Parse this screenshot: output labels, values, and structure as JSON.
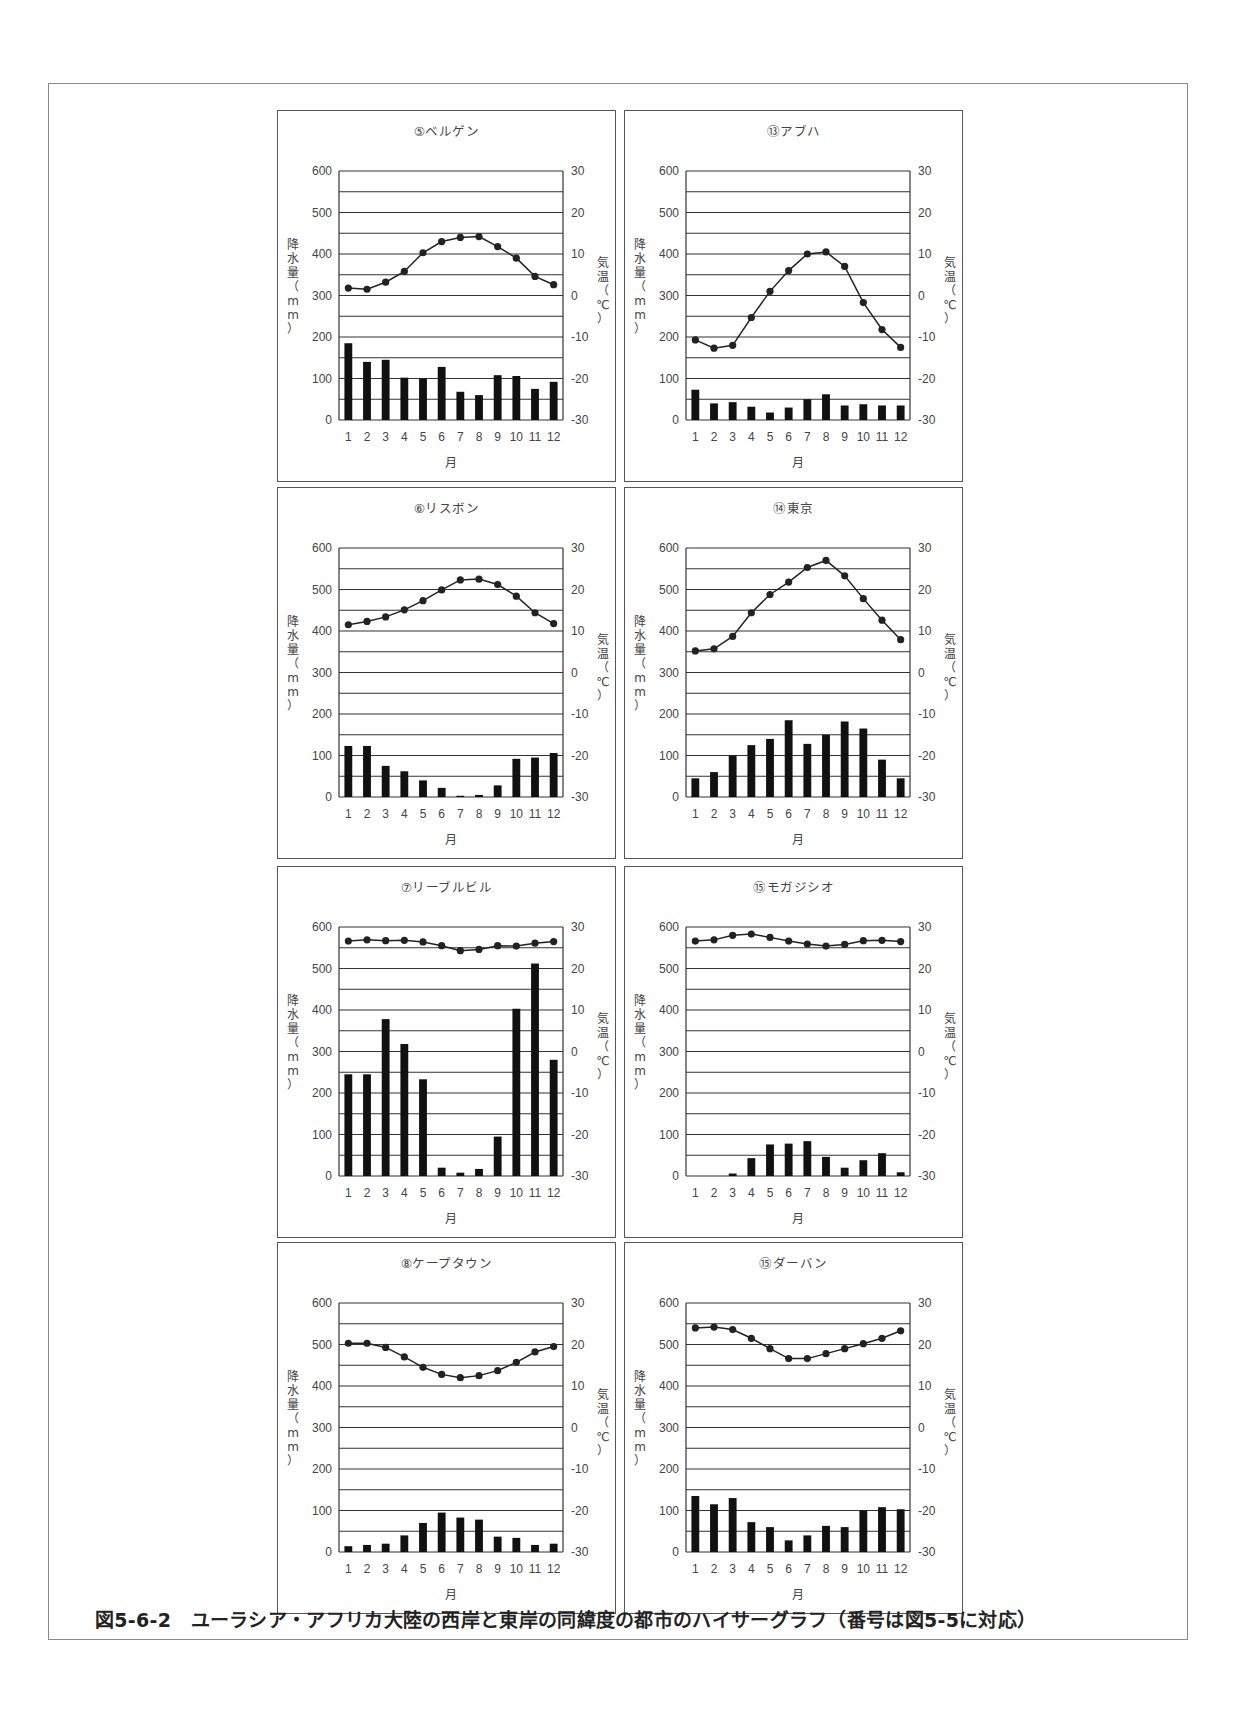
{
  "caption": "図5-6-2　ユーラシア・アフリカ大陸の西岸と東岸の同緯度の都市のハイサーグラフ（番号は図5-5に対応）",
  "axis_labels": {
    "left_vertical": [
      "降",
      "水",
      "量",
      "（",
      "m",
      "m",
      "）"
    ],
    "right_vertical": [
      "気",
      "温",
      "（",
      "℃",
      "）"
    ],
    "x_label": "月"
  },
  "colors": {
    "bar": "#111111",
    "line": "#222222",
    "grid": "#333333",
    "frame": "#555555"
  },
  "chart_data": [
    {
      "type": "bar+line",
      "title": "⑤ベルゲン",
      "categories": [
        "1",
        "2",
        "3",
        "4",
        "5",
        "6",
        "7",
        "8",
        "9",
        "10",
        "11",
        "12"
      ],
      "xlabel": "月",
      "ylabel": "降水量（mm）",
      "y2label": "気温（℃）",
      "ylim": [
        0,
        600
      ],
      "y2lim": [
        -30,
        30
      ],
      "yticks": [
        0,
        100,
        200,
        300,
        400,
        500,
        600
      ],
      "y2ticks": [
        -30,
        -20,
        -10,
        0,
        10,
        20,
        30
      ],
      "grid": true,
      "series": [
        {
          "name": "降水量",
          "axis": "left",
          "kind": "bar",
          "values": [
            185,
            140,
            145,
            102,
            100,
            128,
            68,
            60,
            108,
            106,
            75,
            92
          ]
        },
        {
          "name": "気温",
          "axis": "right",
          "kind": "line",
          "values": [
            1.8,
            1.5,
            3.2,
            5.8,
            10.3,
            13.0,
            14.0,
            14.2,
            11.8,
            9.0,
            4.6,
            2.6
          ]
        }
      ]
    },
    {
      "type": "bar+line",
      "title": "⑬アブハ",
      "categories": [
        "1",
        "2",
        "3",
        "4",
        "5",
        "6",
        "7",
        "8",
        "9",
        "10",
        "11",
        "12"
      ],
      "xlabel": "月",
      "ylabel": "降水量（mm）",
      "y2label": "気温（℃）",
      "ylim": [
        0,
        600
      ],
      "y2lim": [
        -30,
        30
      ],
      "yticks": [
        0,
        100,
        200,
        300,
        400,
        500,
        600
      ],
      "y2ticks": [
        -30,
        -20,
        -10,
        0,
        10,
        20,
        30
      ],
      "grid": true,
      "series": [
        {
          "name": "降水量",
          "axis": "left",
          "kind": "bar",
          "values": [
            73,
            40,
            43,
            32,
            18,
            30,
            50,
            62,
            35,
            38,
            35,
            35
          ]
        },
        {
          "name": "気温",
          "axis": "right",
          "kind": "line",
          "values": [
            -10.7,
            -12.7,
            -12.0,
            -5.3,
            1.0,
            6.0,
            10.0,
            10.5,
            7.0,
            -1.7,
            -8.2,
            -12.5
          ]
        }
      ]
    },
    {
      "type": "bar+line",
      "title": "⑥リスボン",
      "categories": [
        "1",
        "2",
        "3",
        "4",
        "5",
        "6",
        "7",
        "8",
        "9",
        "10",
        "11",
        "12"
      ],
      "xlabel": "月",
      "ylabel": "降水量（mm）",
      "y2label": "気温（℃）",
      "ylim": [
        0,
        600
      ],
      "y2lim": [
        -30,
        30
      ],
      "yticks": [
        0,
        100,
        200,
        300,
        400,
        500,
        600
      ],
      "y2ticks": [
        -30,
        -20,
        -10,
        0,
        10,
        20,
        30
      ],
      "grid": true,
      "series": [
        {
          "name": "降水量",
          "axis": "left",
          "kind": "bar",
          "values": [
            123,
            123,
            75,
            62,
            40,
            22,
            3,
            5,
            28,
            92,
            95,
            106
          ]
        },
        {
          "name": "気温",
          "axis": "right",
          "kind": "line",
          "values": [
            11.5,
            12.3,
            13.4,
            15.1,
            17.3,
            19.9,
            22.3,
            22.5,
            21.2,
            18.4,
            14.4,
            11.8
          ]
        }
      ]
    },
    {
      "type": "bar+line",
      "title": "⑭東京",
      "categories": [
        "1",
        "2",
        "3",
        "4",
        "5",
        "6",
        "7",
        "8",
        "9",
        "10",
        "11",
        "12"
      ],
      "xlabel": "月",
      "ylabel": "降水量（mm）",
      "y2label": "気温（℃）",
      "ylim": [
        0,
        600
      ],
      "y2lim": [
        -30,
        30
      ],
      "yticks": [
        0,
        100,
        200,
        300,
        400,
        500,
        600
      ],
      "y2ticks": [
        -30,
        -20,
        -10,
        0,
        10,
        20,
        30
      ],
      "grid": true,
      "series": [
        {
          "name": "降水量",
          "axis": "left",
          "kind": "bar",
          "values": [
            45,
            60,
            100,
            125,
            140,
            185,
            128,
            150,
            182,
            165,
            90,
            45
          ]
        },
        {
          "name": "気温",
          "axis": "right",
          "kind": "line",
          "values": [
            5.2,
            5.7,
            8.7,
            14.4,
            18.8,
            21.8,
            25.3,
            27.0,
            23.3,
            17.8,
            12.6,
            7.9
          ]
        }
      ]
    },
    {
      "type": "bar+line",
      "title": "⑦リーブルビル",
      "categories": [
        "1",
        "2",
        "3",
        "4",
        "5",
        "6",
        "7",
        "8",
        "9",
        "10",
        "11",
        "12"
      ],
      "xlabel": "月",
      "ylabel": "降水量（mm）",
      "y2label": "気温（℃）",
      "ylim": [
        0,
        600
      ],
      "y2lim": [
        -30,
        30
      ],
      "yticks": [
        0,
        100,
        200,
        300,
        400,
        500,
        600
      ],
      "y2ticks": [
        -30,
        -20,
        -10,
        0,
        10,
        20,
        30
      ],
      "grid": true,
      "series": [
        {
          "name": "降水量",
          "axis": "left",
          "kind": "bar",
          "values": [
            245,
            245,
            378,
            318,
            233,
            20,
            8,
            17,
            95,
            403,
            512,
            280
          ]
        },
        {
          "name": "気温",
          "axis": "right",
          "kind": "line",
          "values": [
            26.6,
            26.9,
            26.7,
            26.8,
            26.4,
            25.5,
            24.3,
            24.6,
            25.5,
            25.4,
            26.1,
            26.5
          ]
        }
      ]
    },
    {
      "type": "bar+line",
      "title": "⑮モガジシオ",
      "categories": [
        "1",
        "2",
        "3",
        "4",
        "5",
        "6",
        "7",
        "8",
        "9",
        "10",
        "11",
        "12"
      ],
      "xlabel": "月",
      "ylabel": "降水量（mm）",
      "y2label": "気温（℃）",
      "ylim": [
        0,
        600
      ],
      "y2lim": [
        -30,
        30
      ],
      "yticks": [
        0,
        100,
        200,
        300,
        400,
        500,
        600
      ],
      "y2ticks": [
        -30,
        -20,
        -10,
        0,
        10,
        20,
        30
      ],
      "grid": true,
      "series": [
        {
          "name": "降水量",
          "axis": "left",
          "kind": "bar",
          "values": [
            0,
            0,
            6,
            43,
            76,
            78,
            84,
            46,
            20,
            38,
            55,
            9
          ]
        },
        {
          "name": "気温",
          "axis": "right",
          "kind": "line",
          "values": [
            26.6,
            26.9,
            28.0,
            28.3,
            27.5,
            26.6,
            25.9,
            25.4,
            25.8,
            26.7,
            26.8,
            26.5
          ]
        }
      ]
    },
    {
      "type": "bar+line",
      "title": "⑧ケープタウン",
      "categories": [
        "1",
        "2",
        "3",
        "4",
        "5",
        "6",
        "7",
        "8",
        "9",
        "10",
        "11",
        "12"
      ],
      "xlabel": "月",
      "ylabel": "降水量（mm）",
      "y2label": "気温（℃）",
      "ylim": [
        0,
        600
      ],
      "y2lim": [
        -30,
        30
      ],
      "yticks": [
        0,
        100,
        200,
        300,
        400,
        500,
        600
      ],
      "y2ticks": [
        -30,
        -20,
        -10,
        0,
        10,
        20,
        30
      ],
      "grid": true,
      "series": [
        {
          "name": "降水量",
          "axis": "left",
          "kind": "bar",
          "values": [
            14,
            17,
            20,
            40,
            70,
            95,
            83,
            78,
            37,
            34,
            17,
            20
          ]
        },
        {
          "name": "気温",
          "axis": "right",
          "kind": "line",
          "values": [
            20.3,
            20.3,
            19.3,
            17.0,
            14.5,
            12.8,
            12.0,
            12.5,
            13.7,
            15.7,
            18.2,
            19.5
          ]
        }
      ]
    },
    {
      "type": "bar+line",
      "title": "⑮ダーバン",
      "categories": [
        "1",
        "2",
        "3",
        "4",
        "5",
        "6",
        "7",
        "8",
        "9",
        "10",
        "11",
        "12"
      ],
      "xlabel": "月",
      "ylabel": "降水量（mm）",
      "y2label": "気温（℃）",
      "ylim": [
        0,
        600
      ],
      "y2lim": [
        -30,
        30
      ],
      "yticks": [
        0,
        100,
        200,
        300,
        400,
        500,
        600
      ],
      "y2ticks": [
        -30,
        -20,
        -10,
        0,
        10,
        20,
        30
      ],
      "grid": true,
      "series": [
        {
          "name": "降水量",
          "axis": "left",
          "kind": "bar",
          "values": [
            135,
            115,
            130,
            72,
            60,
            28,
            40,
            63,
            60,
            100,
            108,
            103
          ]
        },
        {
          "name": "気温",
          "axis": "right",
          "kind": "line",
          "values": [
            24.0,
            24.2,
            23.6,
            21.5,
            19.0,
            16.6,
            16.6,
            17.8,
            19.0,
            20.2,
            21.5,
            23.3
          ]
        }
      ]
    }
  ]
}
